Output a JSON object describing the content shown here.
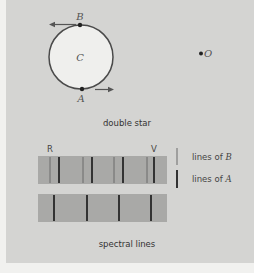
{
  "figure": {
    "top": {
      "caption": "double star",
      "labels": {
        "B": "B",
        "A": "A",
        "C": "C",
        "O": "O"
      }
    },
    "bottom": {
      "caption": "spectral lines",
      "end_labels": {
        "red": "R",
        "violet": "V"
      },
      "legend": [
        {
          "label_prefix": "lines of ",
          "label_var": "B",
          "style": "thin"
        },
        {
          "label_prefix": "lines of ",
          "label_var": "A",
          "style": "thick"
        }
      ]
    },
    "colors": {
      "panel": "#d4d4d2",
      "strip": "#a8a8a6",
      "circle_fill": "#efefed",
      "line": "#3a3a3a",
      "thin_line": "#6a6a6a"
    }
  }
}
